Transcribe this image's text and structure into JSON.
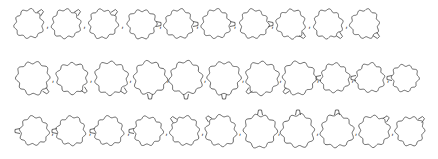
{
  "diagram": {
    "title": "",
    "stroke_color": "#555555",
    "separator": ",",
    "rows": [
      {
        "y": 24,
        "shapes": [
          {
            "cx": 29,
            "r": 14,
            "lobes": 10,
            "tail": "top-right"
          },
          {
            "cx": 66,
            "r": 14,
            "lobes": 10,
            "tail": "top-right"
          },
          {
            "cx": 103,
            "r": 14,
            "lobes": 10,
            "tail": "top-right"
          },
          {
            "cx": 142,
            "r": 14,
            "lobes": 10,
            "tail": "right"
          },
          {
            "cx": 179,
            "r": 14,
            "lobes": 10,
            "tail": "right"
          },
          {
            "cx": 216,
            "r": 14,
            "lobes": 10,
            "tail": "right"
          },
          {
            "cx": 254,
            "r": 14,
            "lobes": 10,
            "tail": "right"
          },
          {
            "cx": 291,
            "r": 14,
            "lobes": 10,
            "tail": "bottom-right"
          },
          {
            "cx": 328,
            "r": 14,
            "lobes": 10,
            "tail": "bottom-right"
          },
          {
            "cx": 365,
            "r": 14,
            "lobes": 10,
            "tail": "bottom-right"
          }
        ]
      },
      {
        "y": 78,
        "shapes": [
          {
            "cx": 33,
            "r": 16,
            "lobes": 10,
            "tail": "bottom-right"
          },
          {
            "cx": 72,
            "r": 15,
            "lobes": 10,
            "tail": "bottom-right"
          },
          {
            "cx": 111,
            "r": 16,
            "lobes": 10,
            "tail": "bottom-right"
          },
          {
            "cx": 150,
            "r": 16,
            "lobes": 10,
            "tail": "bottom"
          },
          {
            "cx": 186,
            "r": 16,
            "lobes": 10,
            "tail": "bottom"
          },
          {
            "cx": 224,
            "r": 16,
            "lobes": 10,
            "tail": "bottom"
          },
          {
            "cx": 262,
            "r": 16,
            "lobes": 10,
            "tail": "bottom-left"
          },
          {
            "cx": 299,
            "r": 16,
            "lobes": 10,
            "tail": "bottom-left"
          },
          {
            "cx": 335,
            "r": 14,
            "lobes": 10,
            "tail": "left"
          },
          {
            "cx": 370,
            "r": 14,
            "lobes": 10,
            "tail": "left"
          },
          {
            "cx": 405,
            "r": 13,
            "lobes": 10,
            "tail": "left"
          }
        ]
      },
      {
        "y": 131,
        "shapes": [
          {
            "cx": 34,
            "r": 14,
            "lobes": 10,
            "tail": "left"
          },
          {
            "cx": 71,
            "r": 14,
            "lobes": 10,
            "tail": "left"
          },
          {
            "cx": 109,
            "r": 14,
            "lobes": 10,
            "tail": "left"
          },
          {
            "cx": 148,
            "r": 14,
            "lobes": 10,
            "tail": "left"
          },
          {
            "cx": 185,
            "r": 14,
            "lobes": 10,
            "tail": "top-left"
          },
          {
            "cx": 221,
            "r": 15,
            "lobes": 10,
            "tail": "top-left"
          },
          {
            "cx": 260,
            "r": 16,
            "lobes": 10,
            "tail": "top"
          },
          {
            "cx": 298,
            "r": 16,
            "lobes": 10,
            "tail": "top"
          },
          {
            "cx": 337,
            "r": 16,
            "lobes": 10,
            "tail": "top"
          },
          {
            "cx": 374,
            "r": 15,
            "lobes": 10,
            "tail": "top-right"
          },
          {
            "cx": 410,
            "r": 14,
            "lobes": 10,
            "tail": "top-right"
          }
        ]
      }
    ]
  }
}
